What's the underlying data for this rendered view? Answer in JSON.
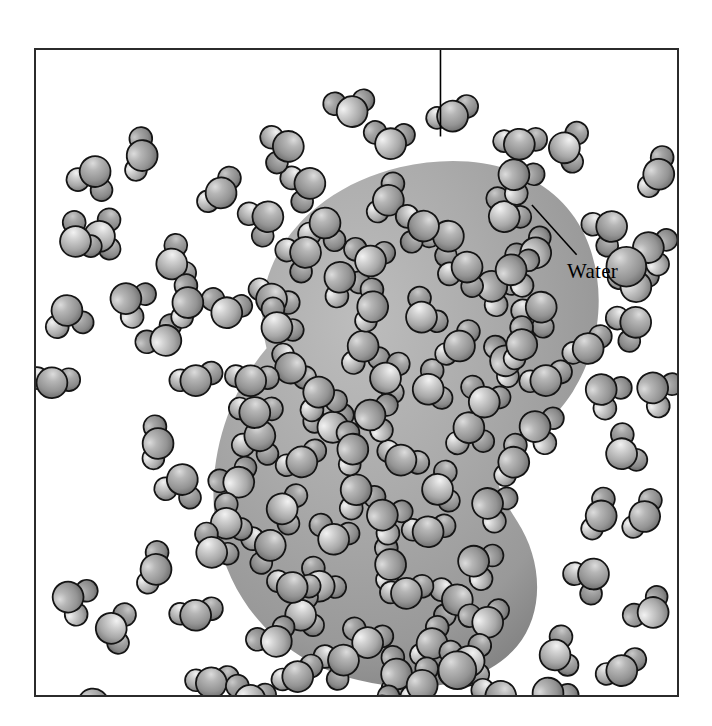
{
  "figure": {
    "kind": "scientific-illustration",
    "background_color": "#ffffff",
    "frame": {
      "x": 34,
      "y": 48,
      "width": 645,
      "height": 649,
      "border_color": "#2b2b2b",
      "border_width": 2
    }
  },
  "labels": [
    {
      "id": "protein",
      "text": "Protein",
      "x": 388,
      "y": 12,
      "leader": {
        "x1": 441,
        "y1": 46,
        "x2": 441,
        "y2": 135
      },
      "color": "#000000"
    },
    {
      "id": "water",
      "text": "Water",
      "x": 565,
      "y": 257,
      "leader": {
        "x1": 578,
        "y1": 254,
        "x2": 533,
        "y2": 204
      },
      "color": "#000000"
    }
  ],
  "protein": {
    "name": "Protein",
    "fill_light": "#b3b3b3",
    "fill_mid": "#a2a2a2",
    "fill_dark": "#7e7e7e",
    "outline": "none",
    "shape_note": "kidney / bean-shaped blob with a concave notch on the right side",
    "path": "M 232 300 C 210 214 274 140 366 118 C 452 98 524 126 552 186 C 576 238 568 300 540 344 C 516 382 480 398 468 420 C 460 436 470 452 484 474 C 510 514 512 566 484 600 C 452 638 388 650 324 634 C 250 616 196 560 182 486 C 170 420 190 350 232 300 Z"
  },
  "water_molecule": {
    "name": "Water",
    "oxygen_color": "#9a9a9a",
    "hydrogen_color": "#b8b8b8",
    "highlight_color": "#e9e9e9",
    "outline_color": "#1a1a1a",
    "oxygen_radius": 15,
    "hydrogen_radius": 11
  },
  "chart_data": {
    "type": "scatter",
    "xlabel": "",
    "ylabel": "",
    "legend": [
      "Protein",
      "Water"
    ],
    "counts": {
      "water_inside_protein": 62,
      "water_outside_protein": 58,
      "total_water": 120
    },
    "molecules_outside": [
      {
        "x": 54,
        "y": 123,
        "r": 0
      },
      {
        "x": 108,
        "y": 108,
        "r": 40
      },
      {
        "x": 72,
        "y": 188,
        "r": 15
      },
      {
        "x": 36,
        "y": 268,
        "r": 60
      },
      {
        "x": 18,
        "y": 330,
        "r": 20
      },
      {
        "x": 128,
        "y": 286,
        "r": 35
      },
      {
        "x": 148,
        "y": 438,
        "r": 70
      },
      {
        "x": 120,
        "y": 520,
        "r": 10
      },
      {
        "x": 84,
        "y": 580,
        "r": 50
      },
      {
        "x": 60,
        "y": 664,
        "r": 25
      },
      {
        "x": 178,
        "y": 632,
        "r": 80
      },
      {
        "x": 240,
        "y": 588,
        "r": 45
      },
      {
        "x": 300,
        "y": 668,
        "r": 30
      },
      {
        "x": 388,
        "y": 636,
        "r": 55
      },
      {
        "x": 444,
        "y": 612,
        "r": 15
      },
      {
        "x": 520,
        "y": 648,
        "r": 65
      },
      {
        "x": 590,
        "y": 620,
        "r": 35
      },
      {
        "x": 618,
        "y": 560,
        "r": 75
      },
      {
        "x": 560,
        "y": 528,
        "r": 20
      },
      {
        "x": 612,
        "y": 466,
        "r": 50
      },
      {
        "x": 596,
        "y": 400,
        "r": 85
      },
      {
        "x": 626,
        "y": 340,
        "r": 10
      },
      {
        "x": 556,
        "y": 296,
        "r": 40
      },
      {
        "x": 604,
        "y": 230,
        "r": 70
      },
      {
        "x": 578,
        "y": 178,
        "r": 25
      },
      {
        "x": 626,
        "y": 122,
        "r": 55
      },
      {
        "x": 540,
        "y": 96,
        "r": 15
      },
      {
        "x": 486,
        "y": 126,
        "r": 80
      },
      {
        "x": 420,
        "y": 62,
        "r": 35
      },
      {
        "x": 318,
        "y": 54,
        "r": 60
      },
      {
        "x": 252,
        "y": 96,
        "r": 20
      },
      {
        "x": 186,
        "y": 140,
        "r": 45
      },
      {
        "x": 144,
        "y": 210,
        "r": 75
      },
      {
        "x": 96,
        "y": 250,
        "r": 30
      }
    ],
    "molecules_inside": [
      {
        "x": 286,
        "y": 172,
        "r": 20
      },
      {
        "x": 352,
        "y": 148,
        "r": 60
      },
      {
        "x": 418,
        "y": 186,
        "r": 35
      },
      {
        "x": 478,
        "y": 160,
        "r": 75
      },
      {
        "x": 236,
        "y": 244,
        "r": 45
      },
      {
        "x": 312,
        "y": 228,
        "r": 15
      },
      {
        "x": 396,
        "y": 262,
        "r": 65
      },
      {
        "x": 470,
        "y": 238,
        "r": 25
      },
      {
        "x": 256,
        "y": 316,
        "r": 55
      },
      {
        "x": 330,
        "y": 300,
        "r": 85
      },
      {
        "x": 404,
        "y": 336,
        "r": 10
      },
      {
        "x": 472,
        "y": 312,
        "r": 50
      },
      {
        "x": 222,
        "y": 388,
        "r": 30
      },
      {
        "x": 300,
        "y": 372,
        "r": 70
      },
      {
        "x": 372,
        "y": 408,
        "r": 40
      },
      {
        "x": 440,
        "y": 382,
        "r": 80
      },
      {
        "x": 252,
        "y": 460,
        "r": 20
      },
      {
        "x": 326,
        "y": 444,
        "r": 60
      },
      {
        "x": 398,
        "y": 480,
        "r": 35
      },
      {
        "x": 462,
        "y": 456,
        "r": 15
      },
      {
        "x": 288,
        "y": 532,
        "r": 45
      },
      {
        "x": 356,
        "y": 516,
        "r": 75
      },
      {
        "x": 424,
        "y": 552,
        "r": 25
      },
      {
        "x": 336,
        "y": 588,
        "r": 55
      }
    ]
  }
}
